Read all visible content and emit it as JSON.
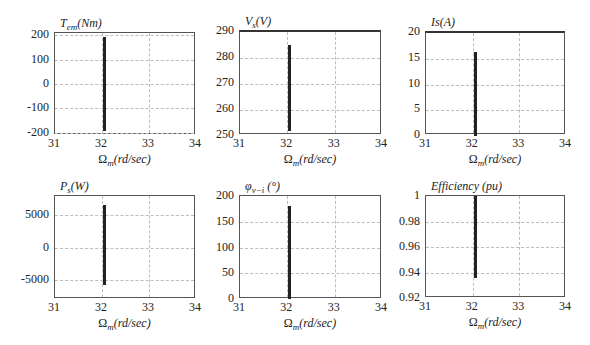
{
  "chart_data": [
    {
      "type": "line",
      "title": "T_em(Nm)",
      "title_main": "T",
      "title_sub": "em",
      "title_rest": "(Nm)",
      "xlabel": "Ωm(rd/sec)",
      "ylabel": "",
      "xlim": [
        31,
        34
      ],
      "ylim": [
        -210,
        210
      ],
      "xticks": [
        "31",
        "32",
        "33",
        "34"
      ],
      "yticks": [
        "200",
        "100",
        "0",
        "-100",
        "-200"
      ],
      "grid": true,
      "series": [
        {
          "name": "Tem",
          "x": [
            32.05,
            32.05
          ],
          "y": [
            -195,
            195
          ]
        }
      ]
    },
    {
      "type": "line",
      "title": "V_s(V)",
      "title_main": "V",
      "title_sub": "s",
      "title_rest": "(V)",
      "xlabel": "Ωm(rd/sec)",
      "ylabel": "",
      "xlim": [
        31,
        34
      ],
      "ylim": [
        250,
        290
      ],
      "xticks": [
        "31",
        "32",
        "33",
        "34"
      ],
      "yticks": [
        "290",
        "280",
        "270",
        "260",
        "250"
      ],
      "grid": true,
      "series": [
        {
          "name": "Vs",
          "x": [
            32.05,
            32.05
          ],
          "y": [
            252,
            285
          ]
        }
      ]
    },
    {
      "type": "line",
      "title": "Is(A)",
      "title_main": "Is(A)",
      "title_sub": "",
      "title_rest": "",
      "xlabel": "Ωm(rd/sec)",
      "ylabel": "",
      "xlim": [
        31,
        34
      ],
      "ylim": [
        0,
        20
      ],
      "xticks": [
        "31",
        "32",
        "33",
        "34"
      ],
      "yticks": [
        "20",
        "15",
        "10",
        "5",
        "0"
      ],
      "grid": true,
      "series": [
        {
          "name": "Is",
          "x": [
            32.05,
            32.05
          ],
          "y": [
            0,
            16.3
          ]
        }
      ]
    },
    {
      "type": "line",
      "title": "P_s(W)",
      "title_main": "P",
      "title_sub": "s",
      "title_rest": "(W)",
      "xlabel": "Ωm(rd/sec)",
      "ylabel": "",
      "xlim": [
        31,
        34
      ],
      "ylim": [
        -8000,
        8000
      ],
      "xticks": [
        "31",
        "32",
        "33",
        "34"
      ],
      "yticks": [
        "5000",
        "0",
        "-5000"
      ],
      "grid": true,
      "series": [
        {
          "name": "Ps",
          "x": [
            32.05,
            32.05
          ],
          "y": [
            -5800,
            6600
          ]
        }
      ]
    },
    {
      "type": "line",
      "title": "φ_v-i (°)",
      "title_main": "φ",
      "title_sub": "v−i",
      "title_rest": " (°)",
      "xlabel": "Ωm(rd/sec)",
      "ylabel": "",
      "xlim": [
        31,
        34
      ],
      "ylim": [
        0,
        200
      ],
      "xticks": [
        "31",
        "32",
        "33",
        "34"
      ],
      "yticks": [
        "200",
        "150",
        "100",
        "50",
        "0"
      ],
      "grid": true,
      "series": [
        {
          "name": "phi",
          "x": [
            32.05,
            32.05
          ],
          "y": [
            0,
            180
          ]
        }
      ]
    },
    {
      "type": "line",
      "title": "Efficiency (pu)",
      "title_main": "Efficiency (pu)",
      "title_sub": "",
      "title_rest": "",
      "xlabel": "Ωm(rd/sec)",
      "ylabel": "",
      "xlim": [
        31,
        34
      ],
      "ylim": [
        0.92,
        1
      ],
      "xticks": [
        "31",
        "32",
        "33",
        "34"
      ],
      "yticks": [
        "1",
        "0.98",
        "0.96",
        "0.94",
        "0.92"
      ],
      "grid": true,
      "series": [
        {
          "name": "eff",
          "x": [
            32.05,
            32.05
          ],
          "y": [
            0.936,
            1.0
          ]
        }
      ]
    }
  ],
  "xlabel_omega": "Ω",
  "xlabel_sub": "m",
  "xlabel_rest": "(rd/sec)"
}
